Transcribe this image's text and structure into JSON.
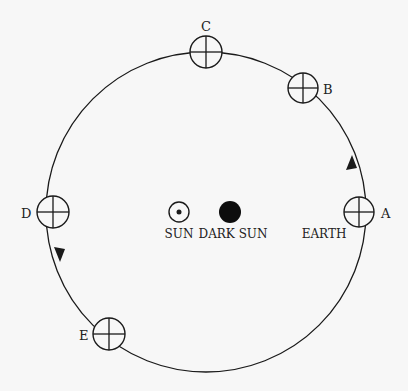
{
  "diagram": {
    "background": "#f7f7f7",
    "stroke": "#1a1a1a",
    "orbit": {
      "cx": 206,
      "cy": 212,
      "r": 160
    },
    "positions": [
      {
        "id": "A",
        "label": "A",
        "cx": 359,
        "cy": 212,
        "label_x": 380,
        "label_y": 218
      },
      {
        "id": "B",
        "label": "B",
        "cx": 303,
        "cy": 88,
        "label_x": 322,
        "label_y": 94
      },
      {
        "id": "C",
        "label": "C",
        "cx": 206,
        "cy": 52,
        "label_x": 206,
        "label_y": 30
      },
      {
        "id": "D",
        "label": "D",
        "cx": 53,
        "cy": 212,
        "label_x": 28,
        "label_y": 218
      },
      {
        "id": "E",
        "label": "E",
        "cx": 109,
        "cy": 334,
        "label_x": 84,
        "label_y": 340
      }
    ],
    "sun": {
      "label": "SUN",
      "cx": 179,
      "cy": 212
    },
    "dark_sun": {
      "label": "DARK SUN",
      "cx": 230,
      "cy": 212
    },
    "earth_label": "EARTH",
    "direction": "counterclockwise"
  }
}
